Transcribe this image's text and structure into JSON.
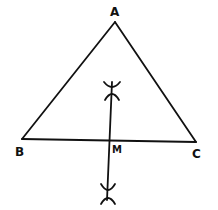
{
  "diagram": {
    "type": "geometry-construction",
    "points": {
      "A": {
        "label": "A",
        "x": 115,
        "y": 22
      },
      "B": {
        "label": "B",
        "x": 22,
        "y": 139
      },
      "C": {
        "label": "C",
        "x": 196,
        "y": 142
      },
      "M": {
        "label": "M",
        "x": 110,
        "y": 141
      }
    },
    "segments": [
      {
        "from": "A",
        "to": "B"
      },
      {
        "from": "A",
        "to": "C"
      },
      {
        "from": "B",
        "to": "C"
      }
    ],
    "bisector": {
      "x1": 112,
      "y1": 82,
      "x2": 107,
      "y2": 200
    },
    "stroke_color": "#111111"
  }
}
